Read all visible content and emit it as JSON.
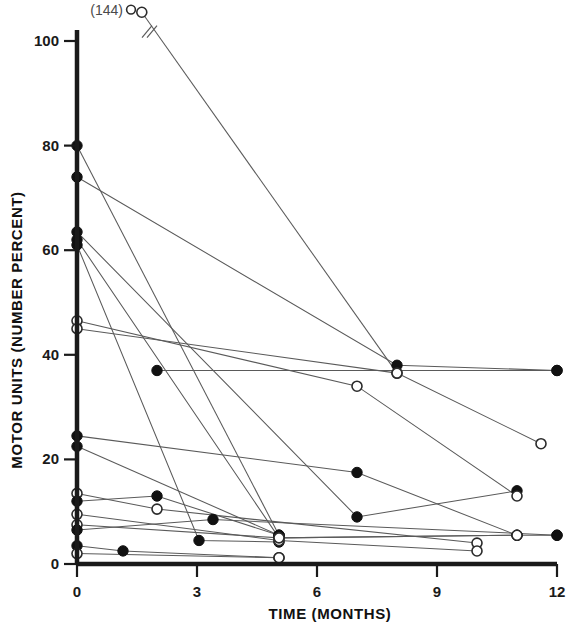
{
  "chart_data": {
    "type": "line",
    "title": "",
    "xlabel": "TIME  (MONTHS)",
    "ylabel": "MOTOR UNITS  (NUMBER PERCENT)",
    "xlim": [
      0,
      12
    ],
    "ylim": [
      0,
      100
    ],
    "xticks": [
      0,
      3,
      6,
      9,
      12
    ],
    "yticks": [
      0,
      20,
      40,
      60,
      80,
      100
    ],
    "xtick_labels": [
      "0",
      "3",
      "6",
      "9",
      "12"
    ],
    "ytick_labels": [
      "0",
      "20",
      "40",
      "60",
      "80",
      "100"
    ],
    "grid": false,
    "legend_position": "none",
    "marker_styles": {
      "filled": "filled-circle",
      "open": "open-circle"
    },
    "annotations": [
      {
        "text": "(144)",
        "x": 1.35,
        "y": 106,
        "marker": "open",
        "note": "off-scale start value, line drawn with axis-break slash"
      }
    ],
    "series": [
      {
        "name": "S1",
        "marker": "open",
        "points": [
          {
            "x": 1.62,
            "y": 105.5
          },
          {
            "x": 8.0,
            "y": 36.5
          }
        ]
      },
      {
        "name": "S2",
        "marker": "filled",
        "points": [
          {
            "x": 0,
            "y": 80.0
          },
          {
            "x": 5.05,
            "y": 5.5
          }
        ]
      },
      {
        "name": "S3",
        "marker": "filled",
        "points": [
          {
            "x": 0,
            "y": 74.0
          },
          {
            "x": 8.0,
            "y": 38.0
          },
          {
            "x": 12.0,
            "y": 37.0
          }
        ]
      },
      {
        "name": "S4",
        "marker": "filled",
        "points": [
          {
            "x": 0,
            "y": 63.5
          },
          {
            "x": 7.0,
            "y": 9.0
          },
          {
            "x": 11.0,
            "y": 14.0
          }
        ]
      },
      {
        "name": "S5",
        "marker": "filled",
        "points": [
          {
            "x": 0,
            "y": 62.0
          },
          {
            "x": 5.05,
            "y": 5.0
          },
          {
            "x": 11.0,
            "y": 5.5
          },
          {
            "x": 12.0,
            "y": 5.5
          }
        ]
      },
      {
        "name": "S6",
        "marker": "filled",
        "points": [
          {
            "x": 0,
            "y": 61.0
          },
          {
            "x": 3.05,
            "y": 4.5
          },
          {
            "x": 5.05,
            "y": 4.2
          }
        ]
      },
      {
        "name": "S7",
        "marker": "open",
        "points": [
          {
            "x": 0,
            "y": 46.5
          },
          {
            "x": 7.0,
            "y": 34.0
          },
          {
            "x": 11.0,
            "y": 13.0
          }
        ]
      },
      {
        "name": "S8",
        "marker": "open",
        "points": [
          {
            "x": 0,
            "y": 45.0
          },
          {
            "x": 8.0,
            "y": 36.5
          },
          {
            "x": 11.6,
            "y": 23.0
          }
        ]
      },
      {
        "name": "S9",
        "marker": "filled",
        "points": [
          {
            "x": 2.0,
            "y": 37.0
          },
          {
            "x": 12.0,
            "y": 37.0
          }
        ]
      },
      {
        "name": "S10",
        "marker": "filled",
        "points": [
          {
            "x": 0,
            "y": 24.5
          },
          {
            "x": 7.0,
            "y": 17.5
          },
          {
            "x": 11.0,
            "y": 5.5
          }
        ]
      },
      {
        "name": "S11",
        "marker": "filled",
        "points": [
          {
            "x": 0,
            "y": 22.5
          },
          {
            "x": 5.05,
            "y": 5.5
          }
        ]
      },
      {
        "name": "S12",
        "marker": "open",
        "points": [
          {
            "x": 0,
            "y": 13.5
          },
          {
            "x": 2.0,
            "y": 10.5
          },
          {
            "x": 10.0,
            "y": 4.0
          }
        ]
      },
      {
        "name": "S13",
        "marker": "filled",
        "points": [
          {
            "x": 0,
            "y": 12.0
          },
          {
            "x": 2.0,
            "y": 13.0
          },
          {
            "x": 5.05,
            "y": 5.5
          }
        ]
      },
      {
        "name": "S14",
        "marker": "open",
        "points": [
          {
            "x": 0,
            "y": 9.5
          },
          {
            "x": 5.05,
            "y": 4.5
          },
          {
            "x": 10.0,
            "y": 2.5
          }
        ]
      },
      {
        "name": "S15",
        "marker": "open",
        "points": [
          {
            "x": 0,
            "y": 7.5
          },
          {
            "x": 5.05,
            "y": 5.0
          },
          {
            "x": 11.0,
            "y": 5.5
          }
        ]
      },
      {
        "name": "S16",
        "marker": "filled",
        "points": [
          {
            "x": 0,
            "y": 6.5
          },
          {
            "x": 3.4,
            "y": 8.5
          },
          {
            "x": 12.0,
            "y": 5.5
          }
        ]
      },
      {
        "name": "S17",
        "marker": "filled",
        "points": [
          {
            "x": 0,
            "y": 3.5
          },
          {
            "x": 1.15,
            "y": 2.5
          },
          {
            "x": 5.05,
            "y": 1.2
          }
        ]
      },
      {
        "name": "S18",
        "marker": "open",
        "points": [
          {
            "x": 0,
            "y": 2.0
          },
          {
            "x": 5.05,
            "y": 1.2
          }
        ]
      }
    ]
  }
}
